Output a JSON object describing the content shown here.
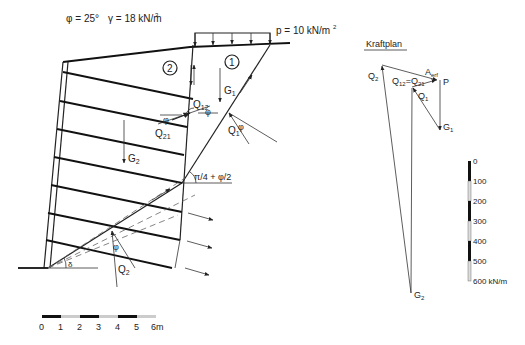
{
  "parameters": {
    "phi": "φ = 25°",
    "gamma": "γ = 18 kN/m",
    "gamma_sup": "3",
    "load": "p = 10 kN/m",
    "load_sup": "2"
  },
  "wedges": {
    "wedge1": "1",
    "wedge2": "2"
  },
  "forces": {
    "G1": "G",
    "G1_sub": "1",
    "G2": "G",
    "G2_sub": "2",
    "Q1": "Q",
    "Q1_sub": "1",
    "Q2": "Q",
    "Q2_sub": "2",
    "Q12": "Q",
    "Q12_sub": "12",
    "Q21": "Q",
    "Q21_sub": "21",
    "phi": "φ",
    "delta": "δ",
    "angle_label": "π/4 + φ/2"
  },
  "kraftplan": {
    "title": "Kraftplan",
    "Q2": "Q",
    "Q2_sub": "2",
    "Q12": "Q",
    "Q12_sub": "12",
    "eq": "=",
    "Q21": "Q",
    "Q21_sub": "21",
    "Aerf": "A",
    "Aerf_sub": "erf",
    "P": "P",
    "Q1": "Q",
    "Q1_sub": "1",
    "G1": "G",
    "G1_sub": "1",
    "G2": "G",
    "G2_sub": "2"
  },
  "force_scale": {
    "ticks": [
      "0",
      "100",
      "200",
      "300",
      "400",
      "500",
      "600 kN/m"
    ]
  },
  "length_scale": {
    "ticks": [
      "0",
      "1",
      "2",
      "3",
      "4",
      "5",
      "6m"
    ]
  }
}
